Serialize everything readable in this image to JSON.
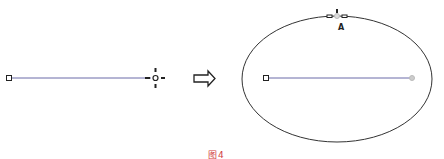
{
  "diagram": {
    "left": {
      "line": {
        "x1": 9,
        "y1": 78,
        "x2": 155,
        "y2": 78,
        "color": "#6a6aa8"
      },
      "start_handle": {
        "label": ""
      },
      "move_handle": {
        "label": ""
      }
    },
    "arrow": {
      "direction": "right"
    },
    "right": {
      "ellipse": {
        "cx": 337,
        "cy": 79,
        "rx": 95,
        "ry": 63,
        "stroke": "#333333"
      },
      "line": {
        "x1": 266,
        "y1": 78,
        "x2": 412,
        "y2": 78,
        "color": "#6a6aa8"
      },
      "top_point_label": "A"
    },
    "caption": "图4"
  },
  "colors": {
    "line": "#6a6aa8",
    "handle": "#222222",
    "ellipse": "#333333",
    "caption": "#d04040"
  }
}
